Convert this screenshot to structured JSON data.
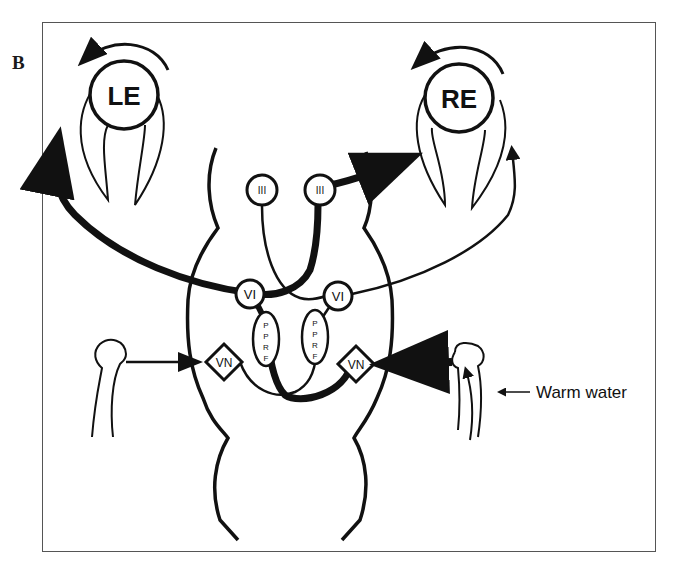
{
  "figure": {
    "panel_label": "B",
    "eyes": {
      "left": "LE",
      "right": "RE"
    },
    "nuclei": {
      "oculomotor_left": "III",
      "oculomotor_right": "III",
      "abducens_left": "VI",
      "abducens_right": "VI",
      "pprf_left": [
        "P",
        "P",
        "R",
        "F"
      ],
      "pprf_right": [
        "P",
        "P",
        "R",
        "F"
      ],
      "vestibular_left": "VN",
      "vestibular_right": "VN"
    },
    "stimulus_label": "Warm water",
    "colors": {
      "ink": "#111111",
      "background": "#ffffff",
      "frame": "#555555"
    }
  }
}
